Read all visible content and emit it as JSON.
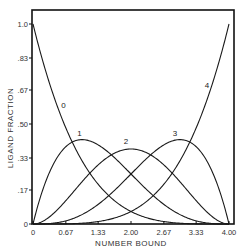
{
  "chart_data": {
    "type": "line",
    "title": "",
    "xlabel": "NUMBER BOUND",
    "ylabel": "LIGAND FRACTION",
    "xlim": [
      0,
      4
    ],
    "ylim": [
      0,
      1.0
    ],
    "grid": false,
    "legend": "inline curve labels",
    "x_ticks": [
      0,
      0.67,
      1.33,
      2.0,
      2.67,
      3.33,
      4.0
    ],
    "x_tick_labels": [
      "0",
      "0.67",
      "1.33",
      "2.00",
      "2.67",
      "3.33",
      "4.00"
    ],
    "y_ticks": [
      0,
      0.17,
      0.33,
      0.5,
      0.67,
      0.83,
      1.0
    ],
    "y_tick_labels": [
      "0",
      ".17",
      ".33",
      ".50",
      ".67",
      ".83",
      "1.0"
    ],
    "x": [
      0,
      0.5,
      1.0,
      1.5,
      2.0,
      2.5,
      3.0,
      3.5,
      4.0
    ],
    "series": [
      {
        "name": "0",
        "values": [
          1.0,
          0.586,
          0.316,
          0.153,
          0.063,
          0.02,
          0.004,
          0.0002,
          0.0
        ]
      },
      {
        "name": "1",
        "values": [
          0.0,
          0.335,
          0.422,
          0.366,
          0.25,
          0.132,
          0.047,
          0.007,
          0.0
        ]
      },
      {
        "name": "2",
        "values": [
          0.0,
          0.072,
          0.211,
          0.33,
          0.375,
          0.33,
          0.211,
          0.072,
          0.0
        ]
      },
      {
        "name": "3",
        "values": [
          0.0,
          0.007,
          0.047,
          0.132,
          0.25,
          0.366,
          0.422,
          0.335,
          0.0
        ]
      },
      {
        "name": "4",
        "values": [
          0.0,
          0.0002,
          0.004,
          0.02,
          0.063,
          0.153,
          0.316,
          0.586,
          1.0
        ]
      }
    ],
    "curve_labels": [
      {
        "name": "0",
        "x": 0.62,
        "y": 0.58
      },
      {
        "name": "1",
        "x": 0.95,
        "y": 0.44
      },
      {
        "name": "2",
        "x": 1.9,
        "y": 0.4
      },
      {
        "name": "3",
        "x": 2.9,
        "y": 0.44
      },
      {
        "name": "4",
        "x": 3.55,
        "y": 0.68
      }
    ],
    "n_sites": 4
  }
}
